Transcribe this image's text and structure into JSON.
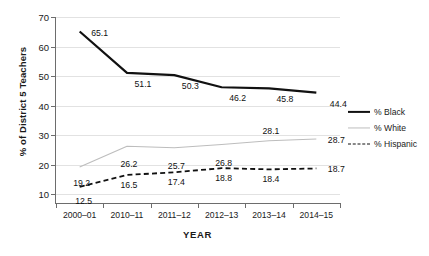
{
  "chart_data": {
    "type": "line",
    "title": "",
    "xlabel": "YEAR",
    "ylabel": "% of District 5 Teachers",
    "categories": [
      "2000–01",
      "2010–11",
      "2011–12",
      "2012–13",
      "2013–14",
      "2014–15"
    ],
    "ylim": [
      7,
      70
    ],
    "yticks": [
      10,
      20,
      30,
      40,
      50,
      60,
      70
    ],
    "ytick_labels": [
      "10",
      "20",
      "30",
      "40",
      "50",
      "60",
      "70"
    ],
    "grid": "horizontal",
    "legend_position": "right",
    "series": [
      {
        "name": "% Black",
        "color": "#111111",
        "style": "solid",
        "width": 2.2,
        "values": [
          65.1,
          51.1,
          50.3,
          46.2,
          45.8,
          44.4
        ],
        "labels": [
          "65.1",
          "51.1",
          "50.3",
          "46.2",
          "45.8",
          "44.4"
        ]
      },
      {
        "name": "% White",
        "color": "#bdbdbd",
        "style": "solid",
        "width": 1.1,
        "values": [
          19.2,
          26.2,
          25.7,
          26.8,
          28.1,
          28.7
        ],
        "labels": [
          "19.2",
          "26.2",
          "25.7",
          "26.8",
          "28.1",
          "28.7"
        ]
      },
      {
        "name": "% Hispanic",
        "color": "#111111",
        "style": "dashed",
        "width": 1.8,
        "values": [
          12.5,
          16.5,
          17.4,
          18.8,
          18.4,
          18.7
        ],
        "labels": [
          "12.5",
          "16.5",
          "17.4",
          "18.8",
          "18.4",
          "18.7"
        ]
      }
    ]
  },
  "legend": {
    "items": [
      {
        "label": "% Black"
      },
      {
        "label": "% White"
      },
      {
        "label": "% Hispanic"
      }
    ]
  }
}
